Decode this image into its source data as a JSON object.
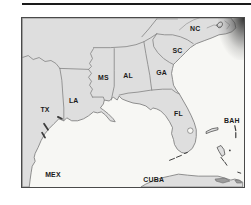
{
  "figure": {
    "type": "outline-map",
    "labels": [
      {
        "id": "tx",
        "text": "TX",
        "x": 44,
        "y": 112
      },
      {
        "id": "la",
        "text": "LA",
        "x": 73,
        "y": 103
      },
      {
        "id": "ms",
        "text": "MS",
        "x": 103,
        "y": 80
      },
      {
        "id": "al",
        "text": "AL",
        "x": 128,
        "y": 78
      },
      {
        "id": "ga",
        "text": "GA",
        "x": 162,
        "y": 75
      },
      {
        "id": "sc",
        "text": "SC",
        "x": 178,
        "y": 52
      },
      {
        "id": "nc",
        "text": "NC",
        "x": 196,
        "y": 30
      },
      {
        "id": "fl",
        "text": "FL",
        "x": 179,
        "y": 116
      },
      {
        "id": "bah",
        "text": "BAH",
        "x": 233,
        "y": 123
      },
      {
        "id": "mex",
        "text": "MEX",
        "x": 52,
        "y": 178
      },
      {
        "id": "cuba",
        "text": "CUBA",
        "x": 154,
        "y": 183
      }
    ],
    "colors": {
      "page": "#ffffff",
      "sea": "#f7f7f4",
      "land": "#dedede",
      "line": "#828282",
      "dark": "#3c3c3c",
      "label": "#1b1b1b",
      "frame": "#4a4a4a",
      "rule": "#1a1a1a"
    }
  }
}
